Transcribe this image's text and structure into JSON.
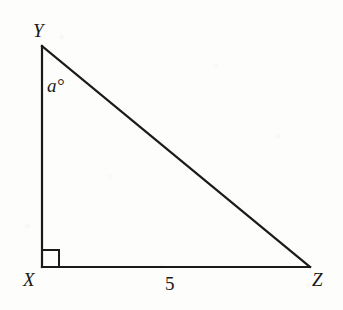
{
  "figure": {
    "kind": "right-triangle-diagram",
    "background_color": "#fdfdfc",
    "stroke_color": "#1a1a1a"
  },
  "vertices": {
    "apex": {
      "name": "Y",
      "label": "Y",
      "x": 42,
      "y": 46
    },
    "right_angle": {
      "name": "X",
      "label": "X",
      "x": 42,
      "y": 267
    },
    "base_right": {
      "name": "Z",
      "label": "Z",
      "x": 310,
      "y": 267
    }
  },
  "angle_marks": {
    "at_Y": {
      "label": "a°",
      "variable": "a",
      "unit": "degrees"
    },
    "at_X": {
      "label": "",
      "type": "right-angle-square",
      "size": 17
    }
  },
  "side_labels": {
    "base_XZ": {
      "label": "5",
      "value": 5
    },
    "leg_XY": {
      "label": ""
    },
    "hypotenuse_YZ": {
      "label": ""
    }
  },
  "icons": {
    "right_angle_square": "right-angle-icon"
  }
}
